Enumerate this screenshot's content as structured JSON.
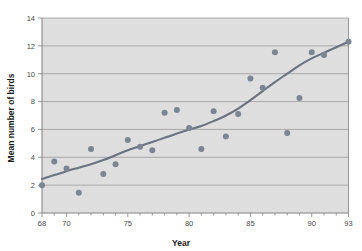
{
  "chart_data": {
    "type": "scatter",
    "title": "",
    "subtitle": "",
    "xlabel": "Year",
    "ylabel": "Mean number of birds",
    "xlim": [
      68,
      93
    ],
    "ylim": [
      0,
      14
    ],
    "xticks": [
      68,
      70,
      75,
      80,
      85,
      90,
      93
    ],
    "xtick_labels": [
      "68",
      "70",
      "75",
      "80",
      "85",
      "90",
      "93"
    ],
    "yticks": [
      0,
      2,
      4,
      6,
      8,
      10,
      12,
      14
    ],
    "ytick_labels": [
      "0",
      "2",
      "4",
      "6",
      "8",
      "10",
      "12",
      "14"
    ],
    "x_minor_tick_step": 1,
    "grid": "horizontal",
    "legend": "none",
    "plot_background": "#e3e3e3",
    "grid_color": "#9a9a9a",
    "point_color": "#7c8593",
    "line_color": "#6b7280",
    "axis_color": "#808080",
    "point_radius": 3,
    "series": [
      {
        "name": "Mean number of birds",
        "type": "scatter",
        "x": [
          68,
          69,
          70,
          71,
          72,
          73,
          74,
          75,
          76,
          77,
          78,
          79,
          80,
          81,
          82,
          83,
          84,
          85,
          86,
          87,
          88,
          89,
          90,
          91,
          93
        ],
        "values": [
          2.0,
          3.7,
          3.2,
          1.45,
          4.6,
          2.8,
          3.5,
          5.25,
          4.75,
          4.5,
          7.2,
          7.4,
          6.1,
          4.6,
          7.3,
          5.5,
          7.1,
          9.65,
          9.0,
          11.55,
          5.75,
          8.25,
          11.55,
          11.35,
          12.3
        ]
      },
      {
        "name": "Smoothed trend",
        "type": "line",
        "x": [
          68,
          69,
          70,
          71,
          72,
          73,
          74,
          75,
          76,
          77,
          78,
          79,
          80,
          81,
          82,
          83,
          84,
          85,
          86,
          87,
          88,
          89,
          90,
          91,
          92,
          93
        ],
        "values": [
          2.45,
          2.72,
          3.0,
          3.25,
          3.5,
          3.8,
          4.15,
          4.5,
          4.8,
          5.1,
          5.4,
          5.7,
          6.0,
          6.25,
          6.6,
          7.0,
          7.5,
          8.1,
          8.75,
          9.4,
          10.0,
          10.6,
          11.1,
          11.5,
          11.9,
          12.3
        ]
      }
    ]
  }
}
